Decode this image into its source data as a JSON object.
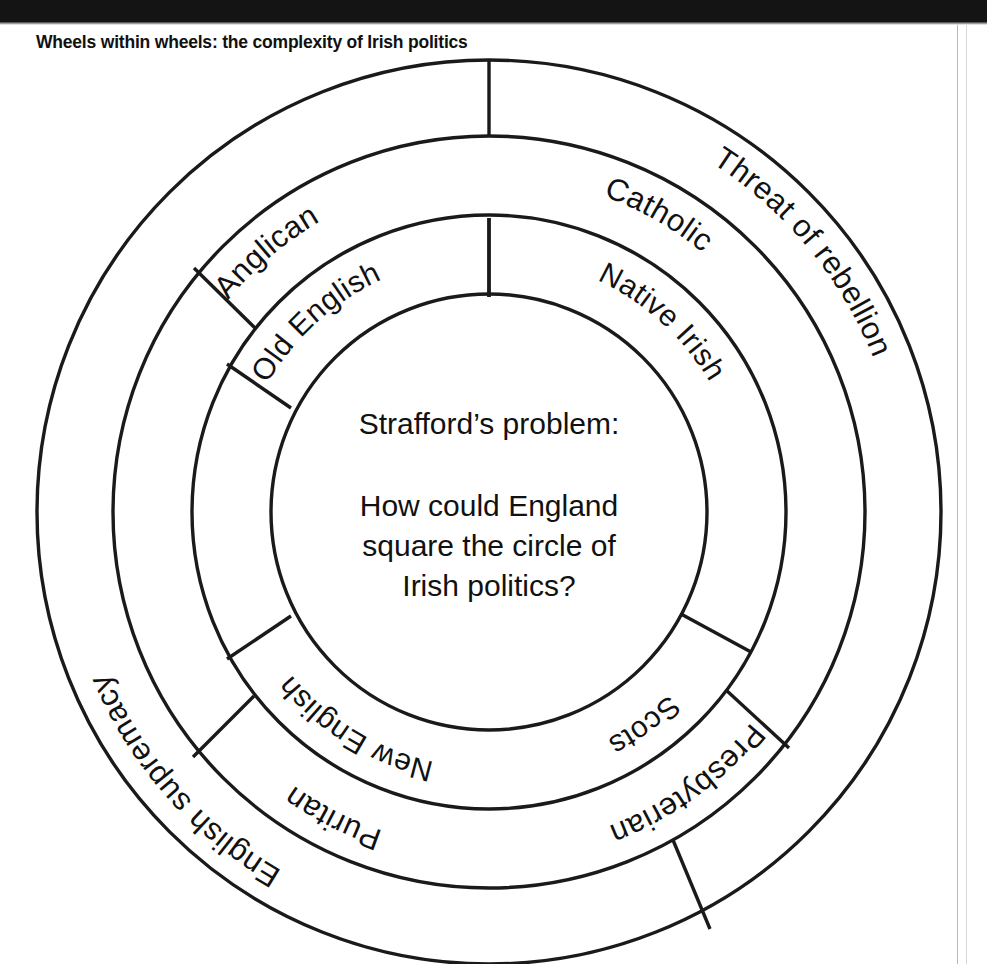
{
  "figure": {
    "title": "Wheels within wheels: the complexity of Irish politics",
    "type": "concentric-ring-diagram",
    "center": {
      "heading": "Strafford’s problem:",
      "line1": "How could England",
      "line2": "square the circle of",
      "line3": "Irish politics?"
    },
    "rings": [
      {
        "name": "inner-ring",
        "order": 1,
        "segments": [
          {
            "label": "Native Irish"
          },
          {
            "label": "Scots"
          },
          {
            "label": "New English"
          },
          {
            "label": "Old English"
          }
        ]
      },
      {
        "name": "middle-ring",
        "order": 2,
        "segments": [
          {
            "label": "Catholic"
          },
          {
            "label": "Presbyterian"
          },
          {
            "label": "Puritan"
          },
          {
            "label": "Anglican"
          }
        ]
      },
      {
        "name": "outer-ring",
        "order": 3,
        "segments": [
          {
            "label": "Threat of rebellion"
          },
          {
            "label": "English supremacy"
          }
        ]
      }
    ],
    "colors": {
      "stroke": "#1a1a1a",
      "background": "#ffffff",
      "text": "#111111",
      "topbar": "#141414"
    }
  }
}
